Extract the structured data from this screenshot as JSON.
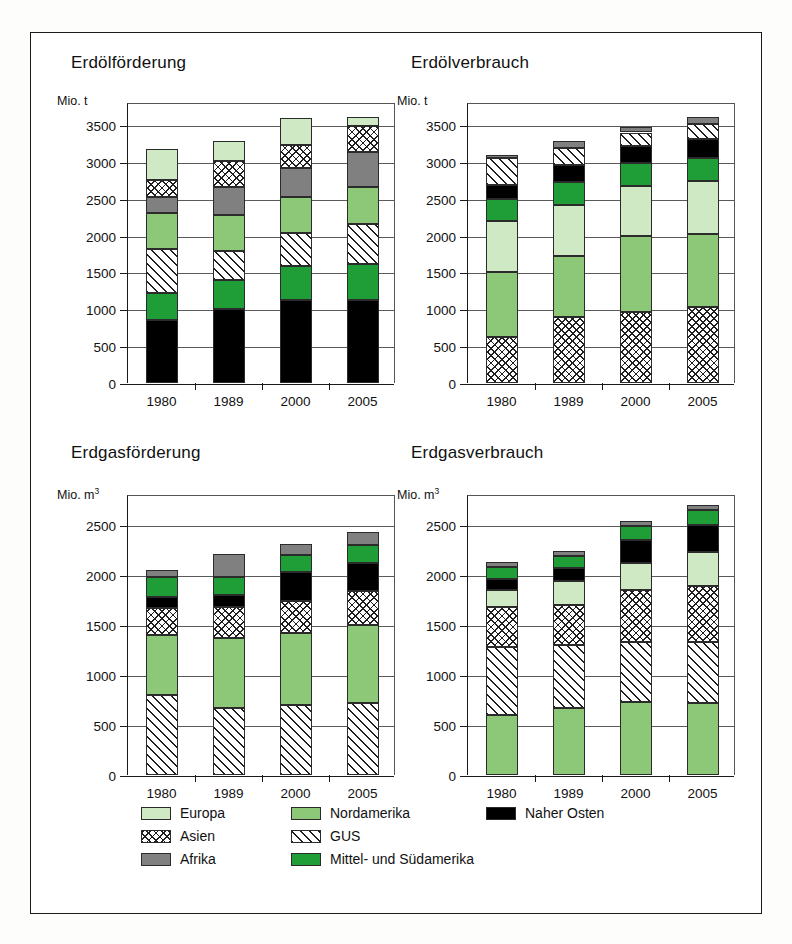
{
  "figure": {
    "legend": {
      "items": [
        {
          "name": "Europa",
          "key": "europa",
          "color": "#cfe9c4",
          "pattern": "solid"
        },
        {
          "name": "Asien",
          "key": "asien",
          "color": "#ffffff",
          "pattern": "cross-hatch"
        },
        {
          "name": "Afrika",
          "key": "afrika",
          "color": "#808080",
          "pattern": "solid"
        },
        {
          "name": "Nordamerika",
          "key": "nordamerika",
          "color": "#8cc878",
          "pattern": "solid"
        },
        {
          "name": "GUS",
          "key": "gus",
          "color": "#ffffff",
          "pattern": "diagonal-hatch"
        },
        {
          "name": "Mittel- und Südamerika",
          "key": "mittelsued",
          "color": "#1f9d36",
          "pattern": "solid"
        },
        {
          "name": "Naher Osten",
          "key": "naherosten",
          "color": "#000000",
          "pattern": "solid"
        }
      ]
    }
  },
  "chart_data": [
    {
      "id": "erdoelfoerderung",
      "type": "bar",
      "stacked": true,
      "title": "Erdölförderung",
      "ylabel": "Mio. t",
      "xlabel": "",
      "categories": [
        "1980",
        "1989",
        "2000",
        "2005"
      ],
      "ylim": [
        0,
        3800
      ],
      "yticks": [
        0,
        500,
        1000,
        1500,
        2000,
        2500,
        3000,
        3500
      ],
      "ytick_labels": [
        "0",
        "500",
        "1000",
        "1500",
        "2000",
        "2500",
        "3000",
        "3500"
      ],
      "grid": true,
      "legend_position": "bottom-shared",
      "stack_order_bottom_to_top": [
        "naherosten",
        "mittelsued",
        "gus",
        "nordamerika",
        "afrika",
        "asien",
        "europa"
      ],
      "series": [
        {
          "name": "Naher Osten",
          "key": "naherosten",
          "values": [
            860,
            1010,
            1120,
            1120
          ]
        },
        {
          "name": "Mittel- und Südamerika",
          "key": "mittelsued",
          "values": [
            360,
            390,
            465,
            500
          ]
        },
        {
          "name": "GUS",
          "key": "gus",
          "values": [
            600,
            390,
            450,
            540
          ]
        },
        {
          "name": "Nordamerika",
          "key": "nordamerika",
          "values": [
            490,
            490,
            490,
            500
          ]
        },
        {
          "name": "Afrika",
          "key": "afrika",
          "values": [
            215,
            380,
            390,
            480
          ]
        },
        {
          "name": "Asien",
          "key": "asien",
          "values": [
            235,
            350,
            320,
            345
          ]
        },
        {
          "name": "Europa",
          "key": "europa",
          "values": [
            415,
            275,
            360,
            130
          ]
        }
      ],
      "totals": [
        3175,
        3285,
        3595,
        3615
      ]
    },
    {
      "id": "erdoelverbrauch",
      "type": "bar",
      "stacked": true,
      "title": "Erdölverbrauch",
      "ylabel": "Mio. t",
      "xlabel": "",
      "categories": [
        "1980",
        "1989",
        "2000",
        "2005"
      ],
      "ylim": [
        0,
        3800
      ],
      "yticks": [
        0,
        500,
        1000,
        1500,
        2000,
        2500,
        3000,
        3500
      ],
      "ytick_labels": [
        "0",
        "500",
        "1000",
        "1500",
        "2000",
        "2500",
        "3000",
        "3500"
      ],
      "grid": true,
      "legend_position": "bottom-shared",
      "stack_order_bottom_to_top": [
        "asien",
        "nordamerika",
        "europa",
        "mittelsued",
        "naherosten",
        "gus",
        "afrika"
      ],
      "series": [
        {
          "name": "Asien",
          "key": "asien",
          "values": [
            620,
            890,
            960,
            1025
          ]
        },
        {
          "name": "Nordamerika",
          "key": "nordamerika",
          "values": [
            890,
            840,
            1040,
            1000
          ]
        },
        {
          "name": "Europa",
          "key": "europa",
          "values": [
            690,
            690,
            670,
            715
          ]
        },
        {
          "name": "Mittel- und Südamerika",
          "key": "mittelsued",
          "values": [
            300,
            305,
            310,
            320
          ]
        },
        {
          "name": "Naher Osten",
          "key": "naherosten",
          "values": [
            190,
            230,
            240,
            245
          ]
        },
        {
          "name": "GUS",
          "key": "gus",
          "values": [
            360,
            230,
            180,
            215
          ]
        },
        {
          "name": "Afrika",
          "key": "afrika",
          "values": [
            45,
            100,
            75,
            85
          ]
        }
      ],
      "totals": [
        3095,
        3285,
        3475,
        3605
      ]
    },
    {
      "id": "erdgasfoerderung",
      "type": "bar",
      "stacked": true,
      "title": "Erdgasförderung",
      "ylabel": "Mio. m³",
      "xlabel": "",
      "categories": [
        "1980",
        "1989",
        "2000",
        "2005"
      ],
      "ylim": [
        0,
        2800
      ],
      "yticks": [
        0,
        500,
        1000,
        1500,
        2000,
        2500
      ],
      "ytick_labels": [
        "0",
        "500",
        "1000",
        "1500",
        "2000",
        "2500"
      ],
      "grid": true,
      "legend_position": "bottom-shared",
      "stack_order_bottom_to_top": [
        "gus",
        "nordamerika",
        "asien",
        "naherosten",
        "mittelsued",
        "afrika"
      ],
      "series": [
        {
          "name": "GUS",
          "key": "gus",
          "values": [
            800,
            670,
            700,
            720
          ]
        },
        {
          "name": "Nordamerika",
          "key": "nordamerika",
          "values": [
            600,
            700,
            720,
            780
          ]
        },
        {
          "name": "Asien",
          "key": "asien",
          "values": [
            275,
            310,
            325,
            340
          ]
        },
        {
          "name": "Naher Osten",
          "key": "naherosten",
          "values": [
            105,
            125,
            285,
            280
          ]
        },
        {
          "name": "Mittel- und Südamerika",
          "key": "mittelsued",
          "values": [
            200,
            175,
            175,
            185
          ]
        },
        {
          "name": "Afrika",
          "key": "afrika",
          "values": [
            75,
            230,
            110,
            130
          ]
        }
      ],
      "totals": [
        2055,
        2210,
        2315,
        2435
      ]
    },
    {
      "id": "erdgasverbrauch",
      "type": "bar",
      "stacked": true,
      "title": "Erdgasverbrauch",
      "ylabel": "Mio. m³",
      "xlabel": "",
      "categories": [
        "1980",
        "1989",
        "2000",
        "2005"
      ],
      "ylim": [
        0,
        2800
      ],
      "yticks": [
        0,
        500,
        1000,
        1500,
        2000,
        2500
      ],
      "ytick_labels": [
        "0",
        "500",
        "1000",
        "1500",
        "2000",
        "2500"
      ],
      "grid": true,
      "legend_position": "bottom-shared",
      "stack_order_bottom_to_top": [
        "nordamerika",
        "gus",
        "asien",
        "europa",
        "naherosten",
        "mittelsued",
        "afrika"
      ],
      "series": [
        {
          "name": "Nordamerika",
          "key": "nordamerika",
          "values": [
            600,
            670,
            730,
            720
          ]
        },
        {
          "name": "GUS",
          "key": "gus",
          "values": [
            680,
            630,
            600,
            610
          ]
        },
        {
          "name": "Asien",
          "key": "asien",
          "values": [
            405,
            400,
            525,
            565
          ]
        },
        {
          "name": "Europa",
          "key": "europa",
          "values": [
            170,
            245,
            265,
            335
          ]
        },
        {
          "name": "Naher Osten",
          "key": "naherosten",
          "values": [
            110,
            130,
            230,
            270
          ]
        },
        {
          "name": "Mittel- und Südamerika",
          "key": "mittelsued",
          "values": [
            120,
            120,
            145,
            150
          ]
        },
        {
          "name": "Afrika",
          "key": "afrika",
          "values": [
            45,
            45,
            45,
            50
          ]
        }
      ],
      "totals": [
        2130,
        2240,
        2540,
        2700
      ]
    }
  ]
}
